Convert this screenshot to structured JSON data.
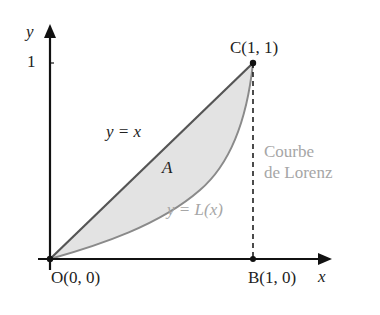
{
  "diagram": {
    "title": "Courbe de Lorenz",
    "axes": {
      "x_label": "x",
      "y_label": "y",
      "y_tick": "1"
    },
    "points": {
      "origin": "O(0, 0)",
      "b": "B(1, 0)",
      "c": "C(1, 1)"
    },
    "labels": {
      "equality_line": "y = x",
      "area": "A",
      "lorenz_curve": "y = L(x)",
      "curve_name_line1": "Courbe",
      "curve_name_line2": "de Lorenz"
    },
    "colors": {
      "axis": "#111111",
      "equality_line": "#555555",
      "lorenz_curve": "#8a8a8a",
      "area_fill": "#e3e3e3",
      "gray_text": "#a6a6a6"
    }
  }
}
